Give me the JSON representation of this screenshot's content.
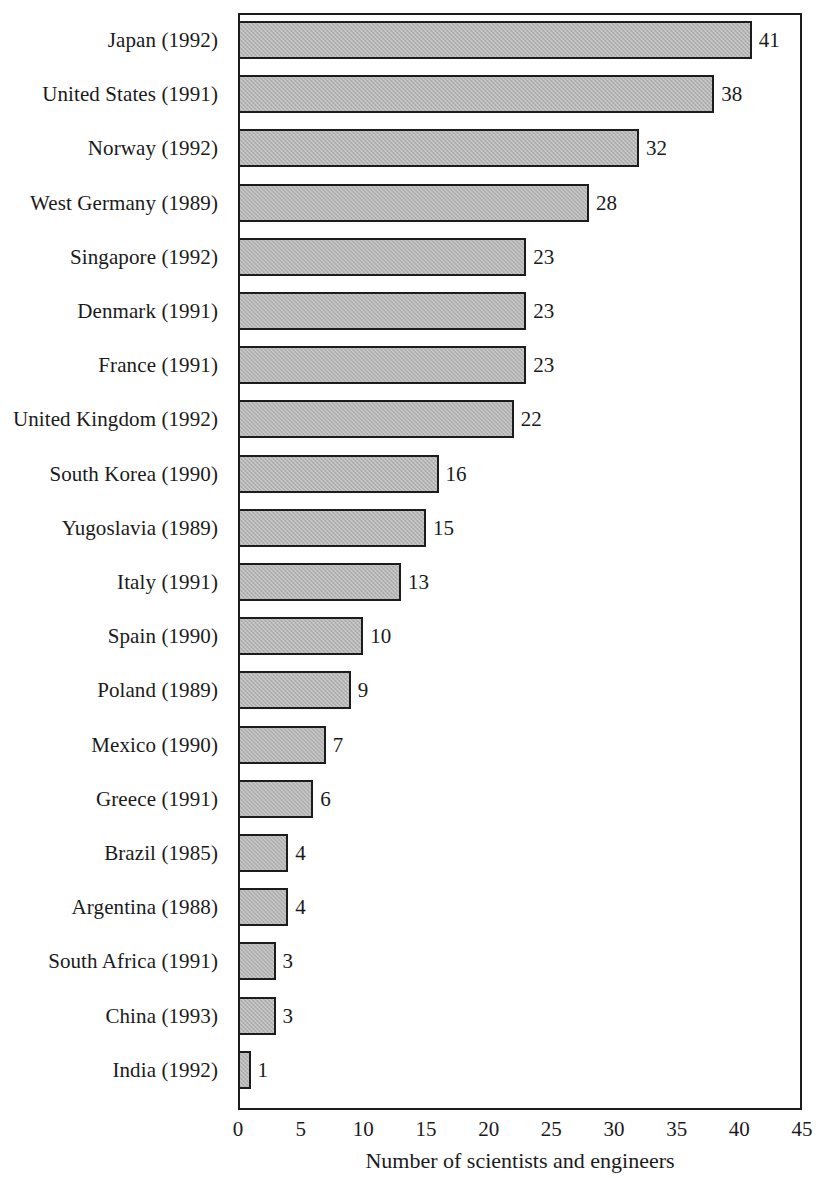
{
  "chart_data": {
    "type": "bar",
    "orientation": "horizontal",
    "title": "",
    "xlabel": "Number of scientists and engineers",
    "ylabel": "",
    "xlim": [
      0,
      45
    ],
    "xticks": [
      0,
      5,
      10,
      15,
      20,
      25,
      30,
      35,
      40,
      45
    ],
    "grid": false,
    "legend": false,
    "bar_color": "#b3b3b3",
    "bar_border_color": "#1c1c1c",
    "categories": [
      "Japan (1992)",
      "United States (1991)",
      "Norway (1992)",
      "West Germany (1989)",
      "Singapore (1992)",
      "Denmark (1991)",
      "France (1991)",
      "United Kingdom (1992)",
      "South Korea (1990)",
      "Yugoslavia (1989)",
      "Italy (1991)",
      "Spain (1990)",
      "Poland (1989)",
      "Mexico (1990)",
      "Greece (1991)",
      "Brazil (1985)",
      "Argentina (1988)",
      "South Africa (1991)",
      "China (1993)",
      "India (1992)"
    ],
    "values": [
      41,
      38,
      32,
      28,
      23,
      23,
      23,
      22,
      16,
      15,
      13,
      10,
      9,
      7,
      6,
      4,
      4,
      3,
      3,
      1
    ],
    "value_labels": [
      "41",
      "38",
      "32",
      "28",
      "23",
      "23",
      "23",
      "22",
      "16",
      "15",
      "13",
      "10",
      "9",
      "7",
      "6",
      "4",
      "4",
      "3",
      "3",
      "1"
    ],
    "tick_labels": [
      "0",
      "5",
      "10",
      "15",
      "20",
      "25",
      "30",
      "35",
      "40",
      "45"
    ]
  }
}
